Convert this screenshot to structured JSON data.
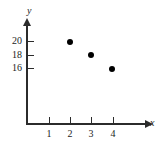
{
  "chart_data": {
    "type": "scatter",
    "title": "",
    "xlabel": "x",
    "ylabel": "y",
    "x": [
      2,
      3,
      4
    ],
    "values": [
      20,
      18,
      16
    ],
    "points": [
      {
        "x": 2,
        "y": 20
      },
      {
        "x": 3,
        "y": 18
      },
      {
        "x": 4,
        "y": 16
      }
    ],
    "xticks": [
      1,
      2,
      3,
      4
    ],
    "xtick_labels": [
      "1",
      "2",
      "3",
      "4"
    ],
    "yticks": [
      16,
      18,
      20
    ],
    "ytick_labels": [
      "16",
      "18",
      "20"
    ],
    "xlim": [
      0,
      5.7
    ],
    "ylim": [
      0,
      21.5
    ],
    "grid": false,
    "legend": null,
    "marker_color": "#000000",
    "axis_color": "#2b2b2b"
  },
  "axes": {
    "y_name": "y",
    "x_name": "x",
    "y_labels": [
      "20",
      "18",
      "16"
    ],
    "x_labels": [
      "1",
      "2",
      "3",
      "4"
    ]
  }
}
